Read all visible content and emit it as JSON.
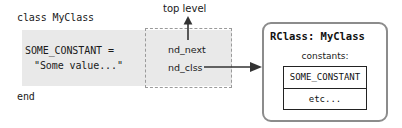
{
  "code": {
    "class_line": "class MyClass",
    "constant_name_line": "SOME_CONSTANT =",
    "constant_value_line": "\"Some value...\"",
    "end_line": "end"
  },
  "node": {
    "top_level_label": "top level",
    "fields": [
      {
        "label": "nd_next"
      },
      {
        "label": "nd_clss"
      }
    ]
  },
  "rclass": {
    "title": "RClass: MyClass",
    "constants_label": "constants:",
    "constants": [
      "SOME_CONSTANT",
      "etc..."
    ]
  },
  "colors": {
    "code_band": "#e9e9e9",
    "dashed_border": "#9a9a9a",
    "panel_border": "#8c8c8c",
    "table_border": "#222222",
    "text": "#1a1a1a",
    "arrow": "#333333"
  }
}
